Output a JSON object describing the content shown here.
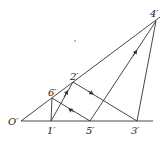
{
  "diagram": {
    "points": {
      "O": {
        "label": "O′",
        "x": 21,
        "y": 121
      },
      "p1": {
        "label": "1′",
        "x": 51,
        "y": 121
      },
      "p5": {
        "label": "5′",
        "x": 90,
        "y": 121
      },
      "p3": {
        "label": "3′",
        "x": 137,
        "y": 121
      },
      "p6": {
        "label": "6′",
        "x": 52,
        "y": 98
      },
      "p2": {
        "label": "2′",
        "x": 73,
        "y": 82
      },
      "p4": {
        "label": "4′",
        "x": 156,
        "y": 21
      }
    },
    "stroke_color": "#333333",
    "background": "#ffffff"
  }
}
